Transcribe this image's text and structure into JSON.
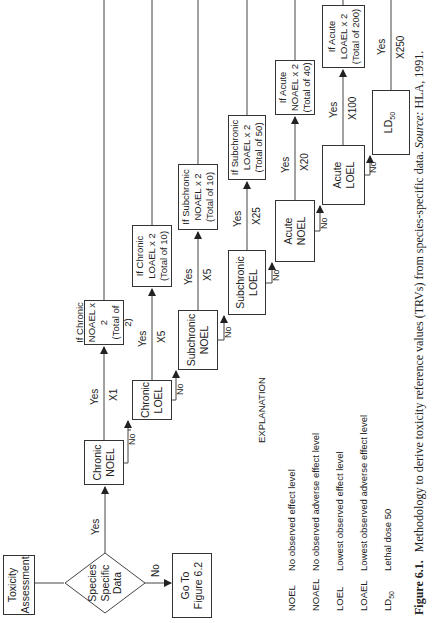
{
  "figure": {
    "orientation": "rotated-90-ccw",
    "caption": {
      "number": "Figure 6.1.",
      "text": "Methodology to derive toxicity reference values (TRVs) from species-specific data.",
      "source_label": "Source:",
      "source": "HLA, 1991."
    }
  },
  "flowchart": {
    "start": {
      "line1": "Toxicity",
      "line2": "Assessment"
    },
    "decision": {
      "line1": "Species",
      "line2": "Specific",
      "line3": "Data"
    },
    "decision_yes": "Yes",
    "decision_no": "No",
    "goto": {
      "line1": "Go To",
      "line2": "Figure 6.2"
    },
    "nodes": [
      {
        "id": "chronic-noel",
        "line1": "Chronic",
        "line2": "NOEL",
        "yes": "Yes",
        "factor": "X1",
        "no": "No",
        "result": {
          "line1": "If Chronic",
          "line2": "NOAEL x 2",
          "line3": "(Total of 2)"
        }
      },
      {
        "id": "chronic-loel",
        "line1": "Chronic",
        "line2": "LOEL",
        "yes": "Yes",
        "factor": "X5",
        "no": "No",
        "result": {
          "line1": "If Chronic",
          "line2": "LOAEL x 2",
          "line3": "(Total of 10)"
        }
      },
      {
        "id": "subchronic-noel",
        "line1": "Subchronic",
        "line2": "NOEL",
        "yes": "Yes",
        "factor": "X5",
        "no": "No",
        "result": {
          "line1": "If Subchronic",
          "line2": "NOAEL x 2",
          "line3": "(Total of 10)"
        }
      },
      {
        "id": "subchronic-loel",
        "line1": "Subchronic",
        "line2": "LOEL",
        "yes": "Yes",
        "factor": "X25",
        "no": "No",
        "result": {
          "line1": "If Subchronic",
          "line2": "LOAEL x 2",
          "line3": "(Total of 50)"
        }
      },
      {
        "id": "acute-noel",
        "line1": "Acute",
        "line2": "NOEL",
        "yes": "Yes",
        "factor": "X20",
        "no": "No",
        "result": {
          "line1": "If Acute",
          "line2": "NOAEL x 2",
          "line3": "(Total of 40)"
        }
      },
      {
        "id": "acute-loel",
        "line1": "Acute",
        "line2": "LOEL",
        "yes": "Yes",
        "factor": "X100",
        "no": "No",
        "result": {
          "line1": "If Acute",
          "line2": "LOAEL x 2",
          "line3": "(Total of 200)"
        }
      },
      {
        "id": "ld50",
        "line1": "LD",
        "sub": "50",
        "yes": "Yes",
        "factor": "X250"
      }
    ]
  },
  "legend": {
    "title": "EXPLANATION",
    "items": [
      {
        "abbr": "NOEL",
        "text": "No observed effect level"
      },
      {
        "abbr": "NOAEL",
        "text": "No observed adverse effect level"
      },
      {
        "abbr": "LOEL",
        "text": "Lowest  observed effect level"
      },
      {
        "abbr": "LOAEL",
        "text": "Lowest observed adverse effect level"
      },
      {
        "abbr": "LD",
        "abbr_sub": "50",
        "text": "Lethal dose 50"
      }
    ]
  }
}
